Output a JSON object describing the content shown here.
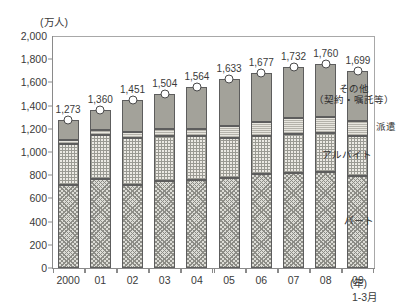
{
  "chart_data": {
    "type": "bar",
    "title": "",
    "subtitle": "",
    "unit_label": "(万人)",
    "xlabel": "(年)",
    "ylabel": "",
    "x_note": "1-3月",
    "grid": false,
    "legend_position": "right-inline",
    "stacked": true,
    "ylim": [
      0,
      2000
    ],
    "yticks": [
      "0",
      "200",
      "400",
      "600",
      "800",
      "1,000",
      "1,200",
      "1,400",
      "1,600",
      "1,800",
      "2,000"
    ],
    "ytick_values": [
      0,
      200,
      400,
      600,
      800,
      1000,
      1200,
      1400,
      1600,
      1800,
      2000
    ],
    "categories": [
      "2000",
      "01",
      "02",
      "03",
      "04",
      "05",
      "06",
      "07",
      "08",
      "09"
    ],
    "totals": [
      1273,
      1360,
      1451,
      1504,
      1564,
      1633,
      1677,
      1732,
      1760,
      1699
    ],
    "total_labels": [
      "1,273",
      "1,360",
      "1,451",
      "1,504",
      "1,564",
      "1,633",
      "1,677",
      "1,732",
      "1,760",
      "1,699"
    ],
    "series": [
      {
        "name": "パート",
        "key": "part",
        "values": [
          719,
          768,
          713,
          748,
          763,
          780,
          809,
          822,
          824,
          795
        ]
      },
      {
        "name": "アルバイト",
        "key": "arbeit",
        "values": [
          353,
          378,
          409,
          391,
          377,
          340,
          331,
          336,
          341,
          343
        ]
      },
      {
        "name": "派遣",
        "key": "haken",
        "values": [
          33,
          45,
          50,
          56,
          62,
          106,
          121,
          133,
          140,
          133
        ]
      },
      {
        "name": "その他（契約・嘱託等）",
        "key": "other",
        "values": [
          168,
          169,
          279,
          309,
          362,
          407,
          416,
          441,
          455,
          428
        ]
      }
    ],
    "annotations": [
      {
        "name": "その他",
        "line1": "その他",
        "line2": "（契約・嘱託等）"
      },
      {
        "name": "派遣",
        "line1": "派遣",
        "line2": ""
      },
      {
        "name": "アルバイト",
        "line1": "アルバイト",
        "line2": ""
      },
      {
        "name": "パート",
        "line1": "パート",
        "line2": ""
      }
    ]
  }
}
